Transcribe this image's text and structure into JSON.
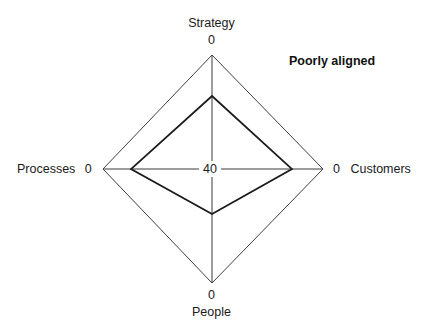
{
  "chart_data": {
    "type": "radar",
    "title": "",
    "annotation": "Poorly aligned",
    "center_label": "40",
    "scale_note": "inverted scale: 40 at center, 0 at outer vertices",
    "axis_min_at_center": 40,
    "axis_max_at_edge": 0,
    "categories": [
      "Strategy",
      "Customers",
      "People",
      "Processes"
    ],
    "tick_labels": [
      "0",
      "0",
      "0",
      "0"
    ],
    "series": [
      {
        "name": "Alignment",
        "values": [
          14,
          13,
          22,
          13
        ]
      }
    ],
    "grid": false,
    "legend": false,
    "xlabel": "",
    "ylabel": ""
  },
  "axes": {
    "top": {
      "name": "Strategy",
      "value": "0"
    },
    "right": {
      "name": "Customers",
      "value": "0"
    },
    "bottom": {
      "name": "People",
      "value": "0"
    },
    "left": {
      "name": "Processes",
      "value": "0"
    }
  },
  "center": {
    "label": "40"
  },
  "annotation": {
    "text": "Poorly aligned"
  },
  "colors": {
    "background": "#ffffff",
    "outline": "#3f3f3f",
    "data_line": "#1b1b1b",
    "text": "#1a1a1a"
  },
  "geometry": {
    "center_x": 212,
    "center_y": 169,
    "outer": {
      "top_y": 55,
      "right_x": 323,
      "bottom_y": 283,
      "left_x": 103
    },
    "inner": {
      "top_y": 96,
      "right_x": 292,
      "bottom_y": 214,
      "left_x": 131
    }
  }
}
